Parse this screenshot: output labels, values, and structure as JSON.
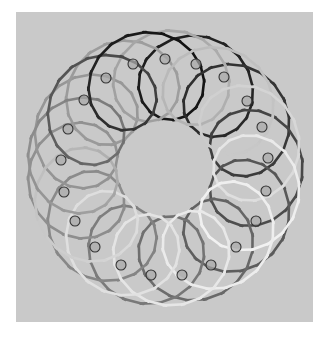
{
  "canvas": {
    "width": 330,
    "height": 341,
    "background": "#ffffff"
  },
  "panel": {
    "x": 16,
    "y": 12,
    "width": 297,
    "height": 310,
    "color": "#c9c9c9"
  },
  "curve": {
    "center": [
      165,
      168
    ],
    "base_radius": 93,
    "loop_radius": 45,
    "loops": 21,
    "turns": 2,
    "stroke_width": 2.6,
    "gradient": [
      "#111111",
      "#555555",
      "#8a8a8a",
      "#a0a0a0",
      "#f2f2f2",
      "#dcdcdc",
      "#111111"
    ],
    "segments": 420
  },
  "nodes": {
    "radius": 5,
    "stroke": "#333333",
    "fill": "#a8a8a8",
    "points": [
      [
        133,
        64
      ],
      [
        165,
        59
      ],
      [
        196,
        64
      ],
      [
        224,
        77
      ],
      [
        247,
        101
      ],
      [
        262,
        127
      ],
      [
        268,
        158
      ],
      [
        266,
        191
      ],
      [
        256,
        221
      ],
      [
        236,
        247
      ],
      [
        211,
        265
      ],
      [
        182,
        275
      ],
      [
        151,
        275
      ],
      [
        121,
        265
      ],
      [
        95,
        247
      ],
      [
        75,
        221
      ],
      [
        64,
        192
      ],
      [
        61,
        160
      ],
      [
        68,
        129
      ],
      [
        84,
        100
      ],
      [
        106,
        78
      ]
    ]
  }
}
